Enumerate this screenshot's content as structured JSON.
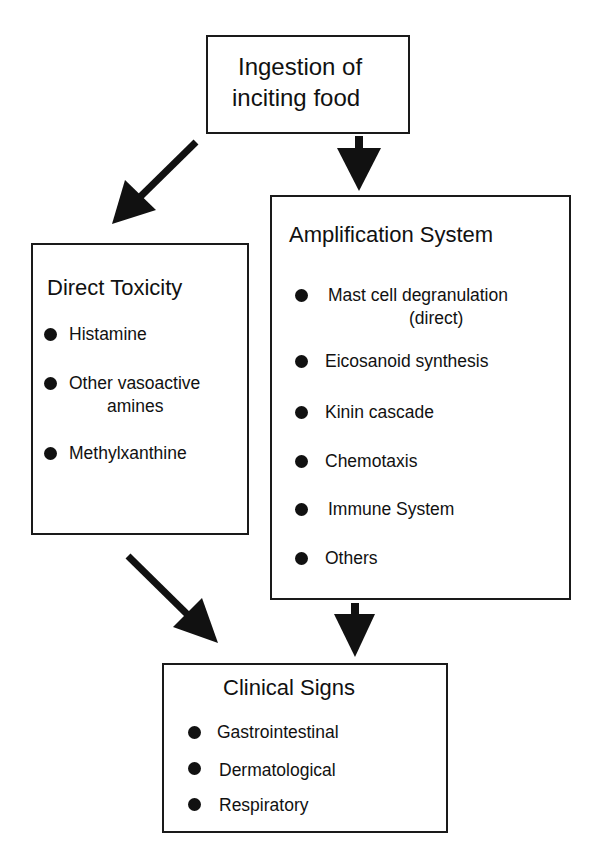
{
  "start": {
    "line1": "Ingestion of",
    "line2": "inciting food"
  },
  "direct_toxicity": {
    "title": "Direct Toxicity",
    "items": [
      {
        "label": "Histamine"
      },
      {
        "label": "Other vasoactive",
        "cont": "amines"
      },
      {
        "label": "Methylxanthine"
      }
    ]
  },
  "amplification": {
    "title": "Amplification System",
    "items": [
      {
        "label": "Mast cell degranulation",
        "cont": "(direct)"
      },
      {
        "label": "Eicosanoid synthesis"
      },
      {
        "label": "Kinin cascade"
      },
      {
        "label": "Chemotaxis"
      },
      {
        "label": "Immune System"
      },
      {
        "label": "Others"
      }
    ]
  },
  "clinical": {
    "title": "Clinical Signs",
    "items": [
      {
        "label": "Gastrointestinal"
      },
      {
        "label": "Dermatological"
      },
      {
        "label": "Respiratory"
      }
    ]
  },
  "colors": {
    "line": "#1a1a1a",
    "background": "#ffffff"
  }
}
